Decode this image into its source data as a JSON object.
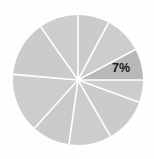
{
  "chart_data": {
    "type": "pie",
    "title": "",
    "subtitle": "",
    "xlabel": "",
    "ylabel": "",
    "legend": [],
    "legend_position": "none",
    "grid": false,
    "background_color": "#fefefe",
    "center": {
      "x": 78,
      "y": 80
    },
    "radius": 65,
    "divider_color": "#ffffff",
    "divider_width": 1.6,
    "start_angle_deg": 90,
    "direction": "counterclockwise",
    "labels": [
      "",
      "",
      "",
      "",
      "",
      "",
      "",
      "",
      "7%",
      ""
    ],
    "values": [
      10,
      13,
      15,
      10,
      11,
      12,
      12,
      10,
      7,
      0
    ],
    "slices": [
      {
        "label": "",
        "value": 10,
        "start_deg": 90,
        "end_deg": 125,
        "color": "#cdcdcd",
        "highlight": false
      },
      {
        "label": "",
        "value": 13,
        "start_deg": 125,
        "end_deg": 175,
        "color": "#cbcbcb",
        "highlight": false
      },
      {
        "label": "",
        "value": 15,
        "start_deg": 175,
        "end_deg": 228,
        "color": "#cdcdcd",
        "highlight": false
      },
      {
        "label": "",
        "value": 10,
        "start_deg": 228,
        "end_deg": 262,
        "color": "#cacaca",
        "highlight": false
      },
      {
        "label": "",
        "value": 11,
        "start_deg": 262,
        "end_deg": 300,
        "color": "#cdcdcd",
        "highlight": false
      },
      {
        "label": "",
        "value": 12,
        "start_deg": 300,
        "end_deg": 340,
        "color": "#cbcbcb",
        "highlight": false
      },
      {
        "label": "",
        "value": 10,
        "start_deg": 340,
        "end_deg": 360,
        "color": "#cdcdcd",
        "highlight": false
      },
      {
        "label": "7%",
        "value": 7,
        "start_deg": 0,
        "end_deg": 28,
        "color": "#b8b8b8",
        "highlight": true
      },
      {
        "label": "",
        "value": 10,
        "start_deg": 28,
        "end_deg": 62,
        "color": "#cdcdcd",
        "highlight": false
      },
      {
        "label": "",
        "value": 10,
        "start_deg": 62,
        "end_deg": 90,
        "color": "#cbcbcb",
        "highlight": false
      }
    ],
    "highlight_label": {
      "text": "7%",
      "x": 121,
      "y": 69,
      "color": "#1b1b1b",
      "font_size": 12.5,
      "bold": true
    }
  }
}
